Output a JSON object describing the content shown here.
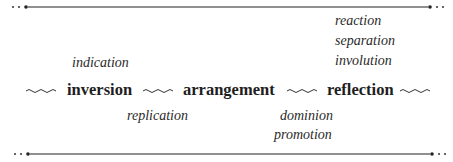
{
  "diagram": {
    "chain": [
      {
        "id": "inversion",
        "label": "inversion"
      },
      {
        "id": "arrangement",
        "label": "arrangement"
      },
      {
        "id": "reflection",
        "label": "reflection"
      }
    ],
    "above": {
      "inversion": [
        "indication"
      ],
      "reflection": [
        "reaction",
        "separation",
        "involution"
      ]
    },
    "below": {
      "arrangement_left": [
        "replication"
      ],
      "arrangement_right": [
        "dominion",
        "promotion"
      ]
    },
    "connector": "wavy-line",
    "frame": "dotted-end rules top and bottom"
  },
  "labels": {
    "indication": "indication",
    "reaction": "reaction",
    "separation": "separation",
    "involution": "involution",
    "inversion": "inversion",
    "arrangement": "arrangement",
    "reflection": "reflection",
    "replication": "replication",
    "dominion": "dominion",
    "promotion": "promotion"
  },
  "colors": {
    "ink": "#222222",
    "background": "#ffffff"
  }
}
